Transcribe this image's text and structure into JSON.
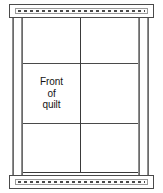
{
  "figure": {
    "background_color": "#ffffff",
    "line_color": "#3a3a3a",
    "rail_color": "#4a4a4a",
    "post_color": "#6b6b6b",
    "text_color": "#141414"
  },
  "quilt": {
    "label_lines": [
      "Front",
      "of",
      "quilt"
    ],
    "label_line_1": "Front",
    "label_line_2": "of",
    "label_line_3": "quilt",
    "columns": 2,
    "rows": 3
  },
  "rails": {
    "top": {
      "name": "top-rail",
      "pattern": "dashed-stitch"
    },
    "bottom": {
      "name": "bottom-rail",
      "pattern": "dashed-stitch"
    }
  },
  "posts": [
    {
      "name": "left-outer-post"
    },
    {
      "name": "left-inner-post"
    },
    {
      "name": "right-inner-post"
    },
    {
      "name": "right-outer-post"
    }
  ]
}
